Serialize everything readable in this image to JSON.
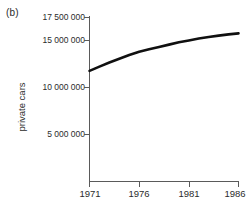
{
  "panel": {
    "label": "(b)"
  },
  "axes": {
    "ylabel": "private cars",
    "xlabel": "",
    "ytick_labels": [
      "17 500 000",
      "15 000 000",
      "10 000 000",
      "5 000 000"
    ],
    "xtick_labels": [
      "1971",
      "1976",
      "1981",
      "1986"
    ]
  },
  "style": {
    "axis_color": "#5a5a5a",
    "line_color": "#101010",
    "text_color": "#2b2b2b",
    "background": "#ffffff",
    "line_width": 2.6
  },
  "chart_data": {
    "type": "line",
    "title": "",
    "subtitle": "",
    "xlabel": "",
    "ylabel": "private cars",
    "panel_label": "(b)",
    "grid": false,
    "legend": false,
    "legend_position": "none",
    "xlim": [
      1971,
      1986
    ],
    "ylim": [
      0,
      17500000
    ],
    "xticks": [
      1971,
      1976,
      1981,
      1986
    ],
    "xtick_labels": [
      "1971",
      "1976",
      "1981",
      "1986"
    ],
    "yticks": [
      5000000,
      10000000,
      15000000,
      17500000
    ],
    "ytick_labels": [
      "5 000 000",
      "10 000 000",
      "15 000 000",
      "17 500 000"
    ],
    "x": [
      1971,
      1972,
      1973,
      1974,
      1975,
      1976,
      1977,
      1978,
      1979,
      1980,
      1981,
      1982,
      1983,
      1984,
      1985,
      1986
    ],
    "series": [
      {
        "name": "private cars",
        "values": [
          11800000,
          12250000,
          12700000,
          13100000,
          13500000,
          13850000,
          14100000,
          14350000,
          14600000,
          14850000,
          15050000,
          15250000,
          15420000,
          15560000,
          15700000,
          15800000
        ]
      }
    ]
  }
}
